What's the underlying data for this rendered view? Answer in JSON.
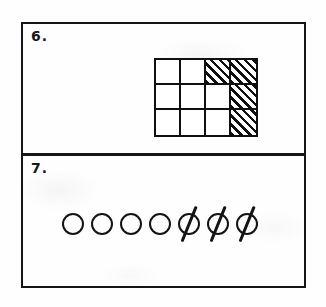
{
  "page": {
    "background_color": "#fefefe",
    "ink_color": "#141414",
    "width": 326,
    "height": 307
  },
  "problems": [
    {
      "number_label": "6.",
      "name": "fraction-grid-problem",
      "figure": {
        "type": "shaded-rectangle-grid",
        "columns": 4,
        "rows": 3,
        "total_cells": 12,
        "shaded_cells": 5,
        "unshaded_cells": 7,
        "shading_style": "diagonal-hatch",
        "hatch_direction": "lower-left-to-upper-right",
        "cells": [
          [
            {
              "row": 1,
              "col": 1,
              "shaded": false
            },
            {
              "row": 1,
              "col": 2,
              "shaded": false
            },
            {
              "row": 1,
              "col": 3,
              "shaded": true
            },
            {
              "row": 1,
              "col": 4,
              "shaded": true
            }
          ],
          [
            {
              "row": 2,
              "col": 1,
              "shaded": false
            },
            {
              "row": 2,
              "col": 2,
              "shaded": false
            },
            {
              "row": 2,
              "col": 3,
              "shaded": false
            },
            {
              "row": 2,
              "col": 4,
              "shaded": true
            }
          ],
          [
            {
              "row": 3,
              "col": 1,
              "shaded": false
            },
            {
              "row": 3,
              "col": 2,
              "shaded": false
            },
            {
              "row": 3,
              "col": 3,
              "shaded": false
            },
            {
              "row": 3,
              "col": 4,
              "shaded": true
            }
          ]
        ]
      }
    },
    {
      "number_label": "7.",
      "name": "crossed-circles-problem",
      "figure": {
        "type": "counter-row",
        "total_circles": 7,
        "plain_circles": 4,
        "crossed_out_circles": 3,
        "cross_out_style": "single-diagonal-slash",
        "slash_direction": "lower-left-to-upper-right",
        "circles": [
          {
            "index": 1,
            "crossed_out": false
          },
          {
            "index": 2,
            "crossed_out": false
          },
          {
            "index": 3,
            "crossed_out": false
          },
          {
            "index": 4,
            "crossed_out": false
          },
          {
            "index": 5,
            "crossed_out": true
          },
          {
            "index": 6,
            "crossed_out": true
          },
          {
            "index": 7,
            "crossed_out": true
          }
        ]
      }
    }
  ]
}
